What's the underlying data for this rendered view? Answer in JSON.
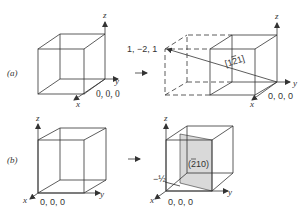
{
  "panels": {
    "a": {
      "label": "(a)",
      "left_cube": {
        "axes": {
          "x": "x",
          "y": "y",
          "z": "z"
        },
        "origin_label": "0, 0, 0"
      },
      "right_cube": {
        "axes": {
          "x": "x",
          "y": "y",
          "z": "z"
        },
        "origin_label": "0, 0, 0",
        "point_label": "1, −2, 1",
        "direction_label": "[1 2̅ 1]",
        "direction_parts": [
          "[1",
          "2",
          "1]"
        ]
      }
    },
    "b": {
      "label": "(b)",
      "left_cube": {
        "axes": {
          "x": "x",
          "y": "y",
          "z": "z"
        },
        "origin_label": "0, 0, 0"
      },
      "right_cube": {
        "axes": {
          "x": "x",
          "y": "y",
          "z": "z"
        },
        "origin_label": "0, 0, 0",
        "intercept_label": "−½",
        "plane_label_parts": [
          "(",
          "2",
          "10)"
        ],
        "plane_fill": "#d9d9d9"
      }
    }
  },
  "arrow_glyph": "→"
}
